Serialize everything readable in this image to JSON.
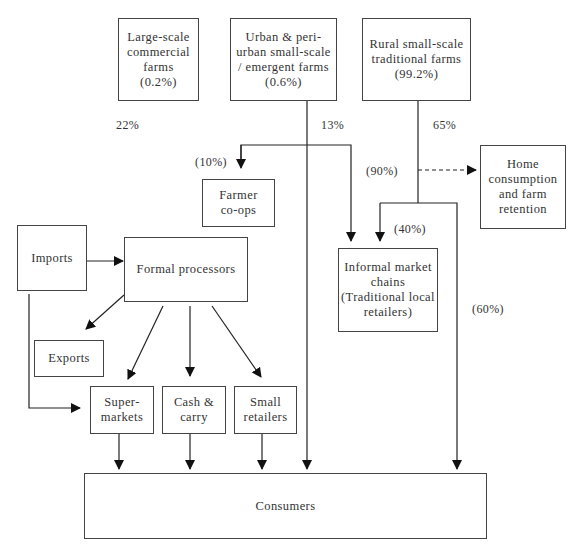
{
  "diagram": {
    "nodes": {
      "large_scale": "Large-scale\ncommercial\nfarms\n(0.2%)",
      "urban": "Urban & peri-\nurban small-scale\n/ emergent farms\n(0.6%)",
      "rural": "Rural small-scale\ntraditional farms\n(99.2%)",
      "farmer_coops": "Farmer\nco-ops",
      "home_consumption": "Home\nconsumption\nand farm\nretention",
      "imports": "Imports",
      "formal_processors": "Formal processors",
      "informal_chains": "Informal market\nchains\n(Traditional local\nretailers)",
      "exports": "Exports",
      "supermarkets": "Super-\nmarkets",
      "cash_carry": "Cash &\ncarry",
      "small_retailers": "Small\nretailers",
      "consumers": "Consumers"
    },
    "labels": {
      "large_share": "22%",
      "urban_share": "13%",
      "rural_share": "65%",
      "coops_share": "(10%)",
      "home_share": "(90%)",
      "informal_share": "(40%)",
      "direct_share": "(60%)"
    },
    "colors": {
      "line": "#222222",
      "border": "#444444",
      "text": "#333333"
    }
  }
}
